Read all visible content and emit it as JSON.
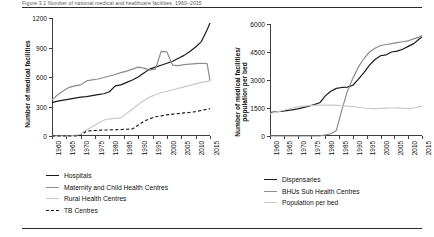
{
  "figure": {
    "caption_strip": "Figure 3.1  Number of national medical and healthcare facilities, 1960–2015",
    "colors": {
      "black": "#1a1a1a",
      "mid_gray": "#8c8c8c",
      "light_gray": "#c9c9c9"
    }
  },
  "chart_data": [
    {
      "type": "line",
      "panel": "left",
      "title": "",
      "xlabel": "",
      "ylabel": "Number of medical facilities",
      "xlim": [
        1960,
        2015
      ],
      "ylim": [
        0,
        1200
      ],
      "yticks": [
        0,
        300,
        600,
        900,
        1200
      ],
      "xticks": [
        1960,
        1965,
        1970,
        1975,
        1980,
        1985,
        1990,
        1995,
        2000,
        2005,
        2010,
        2015
      ],
      "grid": false,
      "legend_position": "below",
      "x": [
        1960,
        1962,
        1964,
        1966,
        1968,
        1970,
        1972,
        1974,
        1976,
        1978,
        1980,
        1982,
        1984,
        1986,
        1988,
        1990,
        1992,
        1994,
        1996,
        1998,
        2000,
        2002,
        2004,
        2006,
        2008,
        2010,
        2012,
        2014,
        2015
      ],
      "series": [
        {
          "name": "Hospitals",
          "style": "solid",
          "color": "#1a1a1a",
          "values": [
            340,
            355,
            365,
            375,
            385,
            395,
            400,
            410,
            420,
            430,
            450,
            510,
            520,
            545,
            570,
            600,
            640,
            680,
            700,
            720,
            740,
            760,
            790,
            820,
            860,
            905,
            960,
            1080,
            1150
          ]
        },
        {
          "name": "Maternity and Child Health Centres",
          "style": "solid",
          "color": "#8c8c8c",
          "values": [
            370,
            420,
            460,
            495,
            510,
            520,
            560,
            570,
            580,
            595,
            610,
            625,
            645,
            660,
            680,
            700,
            690,
            670,
            680,
            860,
            855,
            720,
            715,
            725,
            730,
            735,
            740,
            735,
            560
          ]
        },
        {
          "name": "Rural Health Centres",
          "style": "solid",
          "color": "#c9c9c9",
          "values": [
            0,
            0,
            0,
            0,
            5,
            20,
            60,
            95,
            130,
            160,
            175,
            180,
            185,
            230,
            275,
            320,
            360,
            395,
            420,
            440,
            455,
            470,
            485,
            500,
            515,
            530,
            545,
            555,
            560
          ]
        },
        {
          "name": "TB Centres",
          "style": "dashed",
          "color": "#1a1a1a",
          "values": [
            0,
            0,
            0,
            0,
            0,
            5,
            50,
            55,
            58,
            60,
            62,
            64,
            66,
            68,
            72,
            110,
            150,
            175,
            195,
            205,
            215,
            222,
            228,
            235,
            240,
            248,
            260,
            272,
            278
          ]
        }
      ]
    },
    {
      "type": "line",
      "panel": "right",
      "title": "",
      "xlabel": "",
      "ylabel": "Number of medical facilities/ population per bed",
      "xlim": [
        1960,
        2015
      ],
      "ylim": [
        0,
        6000
      ],
      "yticks": [
        0,
        1500,
        3000,
        4500,
        6000
      ],
      "xticks": [
        1960,
        1965,
        1970,
        1975,
        1980,
        1985,
        1990,
        1995,
        2000,
        2005,
        2010,
        2015
      ],
      "grid": false,
      "legend_position": "below",
      "x": [
        1960,
        1962,
        1964,
        1966,
        1968,
        1970,
        1972,
        1974,
        1976,
        1978,
        1980,
        1982,
        1984,
        1986,
        1988,
        1990,
        1992,
        1994,
        1996,
        1998,
        2000,
        2002,
        2004,
        2006,
        2008,
        2010,
        2012,
        2014,
        2015
      ],
      "series": [
        {
          "name": "Dispensaries",
          "style": "solid",
          "color": "#1a1a1a",
          "values": [
            1250,
            1300,
            1320,
            1360,
            1400,
            1450,
            1520,
            1600,
            1680,
            1780,
            2150,
            2400,
            2550,
            2600,
            2620,
            2720,
            3050,
            3400,
            3800,
            4100,
            4300,
            4350,
            4500,
            4550,
            4650,
            4800,
            4950,
            5200,
            5300
          ]
        },
        {
          "name": "BHUs Sub Health Centres",
          "style": "solid",
          "color": "#8c8c8c",
          "values": [
            0,
            0,
            0,
            0,
            0,
            0,
            0,
            0,
            0,
            0,
            60,
            120,
            300,
            1400,
            2400,
            3100,
            3700,
            4150,
            4500,
            4700,
            4850,
            4900,
            4950,
            5000,
            5050,
            5100,
            5200,
            5300,
            5380
          ]
        },
        {
          "name": "Population per bed",
          "style": "solid",
          "color": "#c9c9c9",
          "values": [
            1200,
            1280,
            1340,
            1420,
            1500,
            1560,
            1600,
            1620,
            1640,
            1650,
            1660,
            1655,
            1640,
            1620,
            1600,
            1580,
            1540,
            1500,
            1480,
            1470,
            1480,
            1490,
            1500,
            1510,
            1490,
            1470,
            1500,
            1560,
            1600
          ]
        }
      ]
    }
  ]
}
